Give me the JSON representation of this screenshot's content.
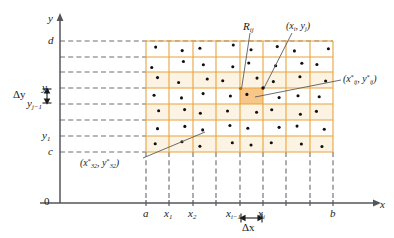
{
  "figure": {
    "type": "math-diagram",
    "colors": {
      "grid": "#E8A33D",
      "grid_light": "#F2C98A",
      "highlight_cell": "#F7C689",
      "axis": "#55565A",
      "dash": "#6E7176",
      "text": "#1A1A1A",
      "point": "#101010",
      "leader": "#5A5B60",
      "background": "#FFFFFF"
    },
    "axes": {
      "x_label": "x",
      "y_label": "y",
      "origin_label": "0",
      "x_axis_y": 203,
      "y_axis_x": 60,
      "x_axis_end": 382,
      "y_axis_top": 14
    },
    "region": {
      "left_px": 146,
      "right_px": 333,
      "top_px": 41,
      "bottom_px": 152,
      "columns": 8,
      "rows": 7
    },
    "x_ticks": [
      {
        "label": "a",
        "sub": "",
        "x": 146
      },
      {
        "label": "x",
        "sub": "1",
        "x": 169
      },
      {
        "label": "x",
        "sub": "2",
        "x": 193
      },
      {
        "label": "x",
        "sub": "i−1",
        "x": 240
      },
      {
        "label": "x",
        "sub": "i",
        "x": 263
      },
      {
        "label": "b",
        "sub": "",
        "x": 333
      }
    ],
    "x_unlabeled_ticks": [
      216,
      286,
      310
    ],
    "y_ticks": [
      {
        "label": "d",
        "sub": "",
        "y": 41
      },
      {
        "label": "y",
        "sub": "j",
        "y": 88
      },
      {
        "label": "y",
        "sub": "j−1",
        "y": 104
      },
      {
        "label": "y",
        "sub": "1",
        "y": 136
      },
      {
        "label": "c",
        "sub": "",
        "y": 152
      }
    ],
    "y_unlabeled_ticks": [
      57,
      72,
      120
    ],
    "annotations": {
      "delta_y": "Δy",
      "delta_x": "Δx",
      "subrectangle": {
        "base": "R",
        "sub": "ij"
      },
      "corner_point": {
        "text_parts": [
          "(",
          "x",
          "i",
          ", ",
          "y",
          "j",
          ")"
        ]
      },
      "sample_point_general": {
        "text": "(x*ij, y*ij)"
      },
      "sample_point_32": {
        "text": "(x*32, y*32)"
      }
    },
    "highlight_cell": {
      "col": 4,
      "row": 4,
      "x": 240,
      "y": 88,
      "w": 23,
      "h": 16
    }
  },
  "chart_data": {
    "type": "scatter",
    "title": "",
    "xlabel": "x",
    "ylabel": "y",
    "note": "Grid partition of rectangle R=[a,b]x[c,d] into m=8 by n=7 subrectangles, each containing one randomly placed sample point (xij*, yij*).",
    "x_tick_labels": [
      "a",
      "x1",
      "x2",
      "",
      "xi-1",
      "xi",
      "",
      "",
      "b"
    ],
    "y_tick_labels": [
      "c",
      "y1",
      "",
      "yj-1",
      "yj",
      "",
      "",
      "d"
    ],
    "grid": true,
    "legend": "none",
    "columns": 8,
    "rows": 7,
    "sample_points_normalized": [
      [
        0.42,
        0.38
      ],
      [
        0.55,
        0.6
      ],
      [
        0.3,
        0.45
      ],
      [
        0.72,
        0.25
      ],
      [
        0.48,
        0.55
      ],
      [
        0.62,
        0.35
      ],
      [
        0.35,
        0.62
      ],
      [
        0.8,
        0.48
      ],
      [
        0.25,
        0.7
      ],
      [
        0.6,
        0.3
      ],
      [
        0.45,
        0.52
      ],
      [
        0.7,
        0.65
      ],
      [
        0.38,
        0.4
      ],
      [
        0.55,
        0.58
      ],
      [
        0.66,
        0.42
      ],
      [
        0.3,
        0.5
      ],
      [
        0.5,
        0.35
      ],
      [
        0.4,
        0.66
      ],
      [
        0.62,
        0.44
      ],
      [
        0.28,
        0.55
      ],
      [
        0.74,
        0.38
      ],
      [
        0.45,
        0.6
      ],
      [
        0.58,
        0.3
      ],
      [
        0.68,
        0.56
      ],
      [
        0.35,
        0.45
      ],
      [
        0.52,
        0.62
      ],
      [
        0.44,
        0.35
      ],
      [
        0.6,
        0.5
      ],
      [
        0.3,
        0.4
      ],
      [
        0.7,
        0.6
      ],
      [
        0.5,
        0.48
      ],
      [
        0.4,
        0.55
      ],
      [
        0.55,
        0.42
      ],
      [
        0.65,
        0.35
      ],
      [
        0.32,
        0.58
      ],
      [
        0.48,
        0.44
      ],
      [
        0.72,
        0.52
      ],
      [
        0.38,
        0.36
      ],
      [
        0.6,
        0.64
      ],
      [
        0.28,
        0.46
      ],
      [
        0.5,
        0.54
      ],
      [
        0.66,
        0.4
      ],
      [
        0.42,
        0.62
      ],
      [
        0.58,
        0.34
      ],
      [
        0.34,
        0.52
      ],
      [
        0.7,
        0.46
      ],
      [
        0.46,
        0.38
      ],
      [
        0.62,
        0.58
      ],
      [
        0.4,
        0.48
      ],
      [
        0.54,
        0.36
      ],
      [
        0.3,
        0.64
      ],
      [
        0.68,
        0.42
      ],
      [
        0.48,
        0.56
      ],
      [
        0.36,
        0.42
      ],
      [
        0.64,
        0.5
      ],
      [
        0.52,
        0.66
      ]
    ]
  }
}
